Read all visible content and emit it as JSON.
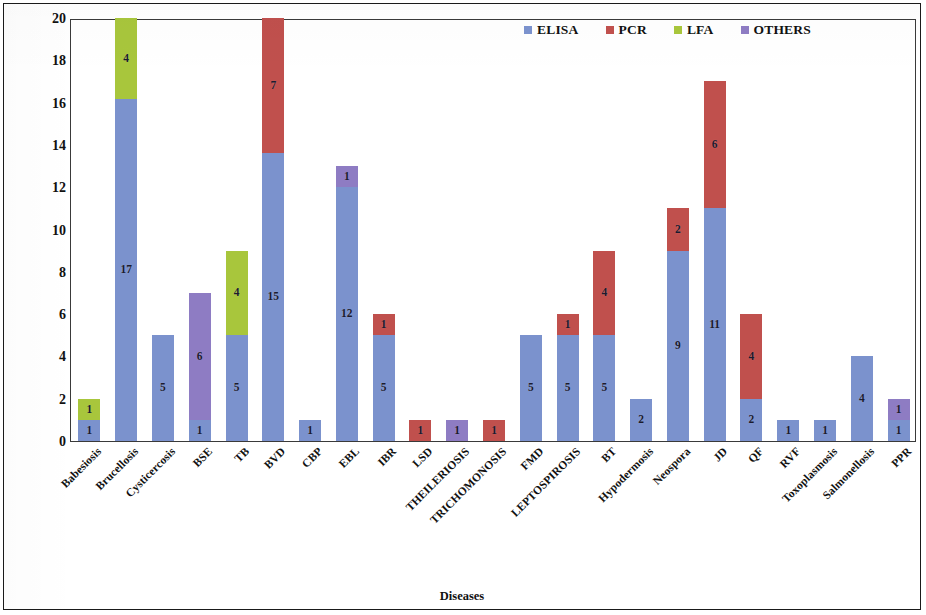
{
  "chart_data": {
    "type": "bar",
    "stacked": true,
    "title": "",
    "xlabel": "Diseases",
    "ylabel": "No of diagnostic kits",
    "ylim": [
      0,
      20
    ],
    "ytick_step": 2,
    "yticks": [
      0,
      2,
      4,
      6,
      8,
      10,
      12,
      14,
      16,
      18,
      20
    ],
    "grid": false,
    "legend_position": "top-right",
    "categories": [
      "Babesiosis",
      "Brucellosis",
      "Cysticercosis",
      "BSE",
      "TB",
      "BVD",
      "CBP",
      "EBL",
      "IBR",
      "LSD",
      "THEILERIOSIS",
      "TRICHOMONOSIS",
      "FMD",
      "LEPTOSPIROSIS",
      "BT",
      "Hypodermosis",
      "Neospora",
      "JD",
      "QF",
      "RVF",
      "Toxoplasmosis",
      "Salmonellosis",
      "PPR"
    ],
    "series": [
      {
        "name": "ELISA",
        "color": "#7b92cd",
        "values": [
          1,
          17,
          5,
          1,
          5,
          15,
          1,
          12,
          5,
          0,
          0,
          0,
          5,
          5,
          5,
          2,
          9,
          11,
          2,
          1,
          1,
          4,
          1
        ]
      },
      {
        "name": "PCR",
        "color": "#c0504d",
        "values": [
          0,
          0,
          0,
          0,
          0,
          7,
          0,
          0,
          1,
          1,
          0,
          1,
          0,
          1,
          4,
          0,
          2,
          6,
          4,
          0,
          0,
          0,
          0
        ]
      },
      {
        "name": "LFA",
        "color": "#a8c63c",
        "values": [
          1,
          4,
          0,
          0,
          4,
          0,
          0,
          0,
          0,
          0,
          0,
          0,
          0,
          0,
          0,
          0,
          0,
          0,
          0,
          0,
          0,
          0,
          0
        ]
      },
      {
        "name": "OTHERS",
        "color": "#8e7cc3",
        "values": [
          0,
          0,
          0,
          6,
          0,
          0,
          0,
          1,
          0,
          0,
          1,
          0,
          0,
          0,
          0,
          0,
          0,
          0,
          0,
          0,
          0,
          0,
          1
        ]
      }
    ],
    "totals": [
      2,
      21,
      5,
      7,
      9,
      22,
      1,
      13,
      6,
      1,
      1,
      1,
      5,
      6,
      9,
      2,
      11,
      17,
      6,
      1,
      1,
      4,
      2
    ]
  },
  "legend": {
    "items": [
      {
        "label": "ELISA",
        "color": "#7b92cd",
        "swatch": "legend-swatch-elisa"
      },
      {
        "label": "PCR",
        "color": "#c0504d",
        "swatch": "legend-swatch-pcr"
      },
      {
        "label": "LFA",
        "color": "#a8c63c",
        "swatch": "legend-swatch-lfa"
      },
      {
        "label": "OTHERS",
        "color": "#8e7cc3",
        "swatch": "legend-swatch-others"
      }
    ]
  },
  "axes": {
    "y_title": "No of diagnostic kits",
    "x_title": "Diseases"
  }
}
